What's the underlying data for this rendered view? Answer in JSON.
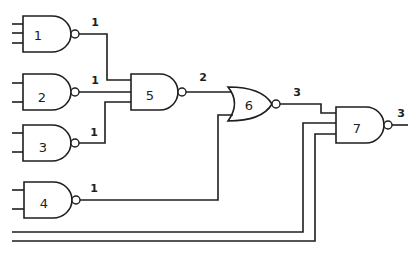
{
  "diagram": {
    "type": "logic-circuit",
    "colors": {
      "line": "#1e1e1e",
      "background": "#ffffff"
    },
    "gates": [
      {
        "id": "1",
        "label": "1",
        "kind": "NAND",
        "inputs": 3,
        "output_level": "1"
      },
      {
        "id": "2",
        "label": "2",
        "kind": "NAND",
        "inputs": 2,
        "output_level": "1"
      },
      {
        "id": "3",
        "label": "3",
        "kind": "NAND",
        "inputs": 2,
        "output_level": "1"
      },
      {
        "id": "4",
        "label": "4",
        "kind": "NAND",
        "inputs": 2,
        "output_level": "1"
      },
      {
        "id": "5",
        "label": "5",
        "kind": "NAND",
        "inputs": 3,
        "output_level": "2"
      },
      {
        "id": "6",
        "label": "6",
        "kind": "NOR",
        "inputs": 2,
        "output_level": "3"
      },
      {
        "id": "7",
        "label": "7",
        "kind": "NAND",
        "inputs": 3,
        "output_level": "3"
      }
    ],
    "wire_labels": {
      "g1_out": "1",
      "g2_out": "1",
      "g3_out": "1",
      "g4_out": "1",
      "g5_out": "2",
      "g6_out": "3",
      "g7_out": "3"
    },
    "connections": [
      {
        "from": "1",
        "to": "5"
      },
      {
        "from": "2",
        "to": "5"
      },
      {
        "from": "3",
        "to": "5"
      },
      {
        "from": "5",
        "to": "6"
      },
      {
        "from": "4",
        "to": "6"
      },
      {
        "from": "6",
        "to": "7"
      },
      {
        "from": "primary-input-a",
        "to": "7"
      },
      {
        "from": "primary-input-b",
        "to": "7"
      }
    ]
  }
}
